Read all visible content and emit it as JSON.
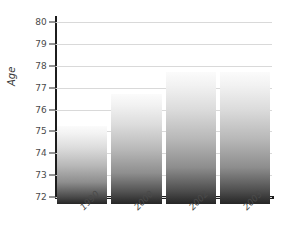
{
  "chart_data": {
    "type": "bar",
    "title": "",
    "subtitle": "",
    "xlabel": "",
    "ylabel": "Age",
    "categories": [
      "1990",
      "2000",
      "2002",
      "2003"
    ],
    "values": [
      75.25,
      76.7,
      77.7,
      77.7
    ],
    "ylim": [
      72,
      80
    ],
    "ytick_labels": [
      "80",
      "79",
      "78",
      "77",
      "76",
      "75",
      "74",
      "73",
      "72"
    ],
    "ytick_values": [
      80,
      79,
      78,
      77,
      76,
      75,
      74,
      73,
      72
    ],
    "grid": true,
    "legend": false,
    "legend_position": "none",
    "series": [
      {
        "name": "Age",
        "values": [
          75.25,
          76.7,
          77.7,
          77.7
        ]
      }
    ],
    "colors": {
      "bar_top": "#fbfbfb",
      "bar_bottom": "#262626",
      "gridline": "#d9d9d9",
      "axis": "#1c1c1c",
      "tick_text": "#4a4a4a",
      "background": "#ffffff"
    }
  }
}
